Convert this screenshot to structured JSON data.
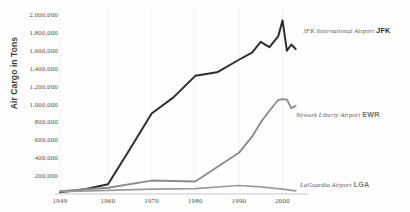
{
  "chart_data": {
    "type": "line",
    "title": "",
    "subtitle": "",
    "xlabel": "",
    "ylabel": "Air Cargo in Tons",
    "xlim": [
      1949,
      2004
    ],
    "ylim": [
      0,
      2100000
    ],
    "grid": "vertical-only",
    "legend_position": "right-inline",
    "x_ticks": [
      "1949",
      "1960",
      "1970",
      "1980",
      "1990",
      "2000"
    ],
    "x_tick_values": [
      1949,
      1960,
      1970,
      1980,
      1990,
      2000
    ],
    "y_ticks": [
      "200,000",
      "400,000",
      "600,000",
      "800,000",
      "1,000,000",
      "1,200,000",
      "1,400,000",
      "1,600,000",
      "1,800,000",
      "2,000,000"
    ],
    "y_tick_values": [
      200000,
      400000,
      600000,
      800000,
      1000000,
      1200000,
      1400000,
      1600000,
      1800000,
      2000000
    ],
    "series": [
      {
        "name": "JFK International Airport",
        "code": "JFK",
        "color": "#2e2e2e",
        "x": [
          1949,
          1955,
          1960,
          1965,
          1970,
          1975,
          1980,
          1985,
          1990,
          1993,
          1995,
          1997,
          1999,
          2000,
          2001,
          2002,
          2003
        ],
        "values": [
          20000,
          55000,
          110000,
          500000,
          900000,
          1080000,
          1320000,
          1360000,
          1500000,
          1580000,
          1700000,
          1640000,
          1760000,
          1940000,
          1600000,
          1670000,
          1620000
        ]
      },
      {
        "name": "Newark Liberty Airport",
        "code": "EWR",
        "color": "#8c8c8c",
        "x": [
          1949,
          1960,
          1970,
          1980,
          1990,
          1993,
          1995,
          1997,
          1999,
          2000,
          2001,
          2002,
          2003
        ],
        "values": [
          30000,
          70000,
          150000,
          140000,
          460000,
          640000,
          800000,
          930000,
          1050000,
          1060000,
          1055000,
          960000,
          985000
        ]
      },
      {
        "name": "LaGuardia Airport",
        "code": "LGA",
        "color": "#9a9a9a",
        "x": [
          1949,
          1960,
          1970,
          1980,
          1990,
          1995,
          2000,
          2003
        ],
        "values": [
          25000,
          40000,
          55000,
          60000,
          95000,
          80000,
          55000,
          35000
        ]
      }
    ]
  }
}
